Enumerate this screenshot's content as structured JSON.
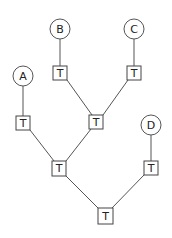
{
  "diagram": {
    "type": "tree",
    "leaves": [
      {
        "id": "A",
        "label": "A"
      },
      {
        "id": "B",
        "label": "B"
      },
      {
        "id": "C",
        "label": "C"
      },
      {
        "id": "D",
        "label": "D"
      }
    ],
    "internal_nodes": [
      {
        "id": "tA",
        "label": "T"
      },
      {
        "id": "tB",
        "label": "T"
      },
      {
        "id": "tC",
        "label": "T"
      },
      {
        "id": "tBC",
        "label": "T"
      },
      {
        "id": "tABC",
        "label": "T"
      },
      {
        "id": "tD",
        "label": "T"
      },
      {
        "id": "root",
        "label": "T"
      }
    ],
    "edges": [
      [
        "A",
        "tA"
      ],
      [
        "B",
        "tB"
      ],
      [
        "C",
        "tC"
      ],
      [
        "D",
        "tD"
      ],
      [
        "tB",
        "tBC"
      ],
      [
        "tC",
        "tBC"
      ],
      [
        "tA",
        "tABC"
      ],
      [
        "tBC",
        "tABC"
      ],
      [
        "tABC",
        "root"
      ],
      [
        "tD",
        "root"
      ]
    ]
  }
}
